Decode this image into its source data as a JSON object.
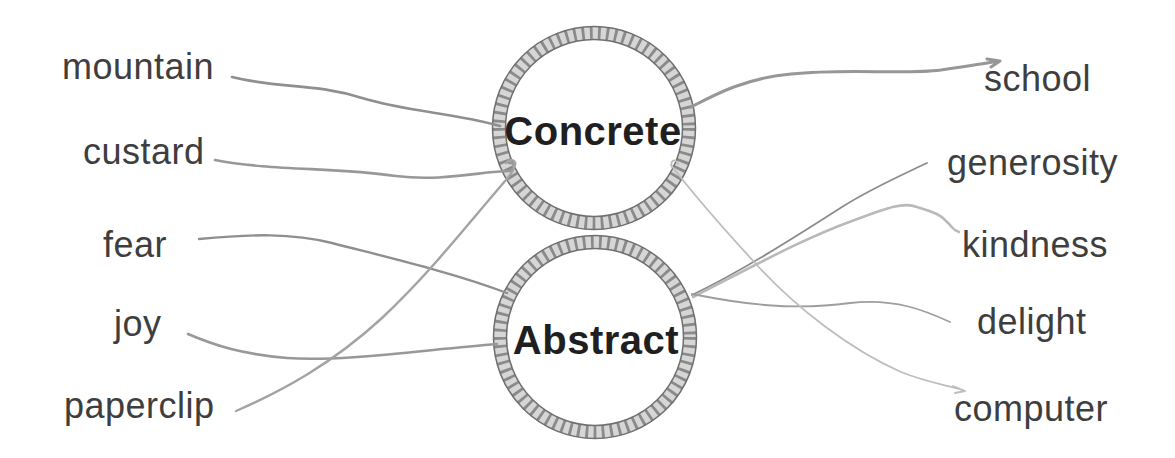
{
  "worksheet": {
    "type": "word-sorting-matching-exercise",
    "background": "#ffffff"
  },
  "categories": [
    {
      "id": "concrete",
      "label": "Concrete"
    },
    {
      "id": "abstract",
      "label": "Abstract"
    }
  ],
  "left_words": [
    {
      "label": "mountain",
      "connected_to": "Concrete"
    },
    {
      "label": "custard",
      "connected_to": "Concrete"
    },
    {
      "label": "fear",
      "connected_to": "Abstract"
    },
    {
      "label": "joy",
      "connected_to": "Abstract"
    },
    {
      "label": "paperclip",
      "connected_to": "Concrete"
    }
  ],
  "right_words": [
    {
      "label": "school",
      "connected_to": "Concrete"
    },
    {
      "label": "generosity",
      "connected_to": "Abstract"
    },
    {
      "label": "kindness",
      "connected_to": "Abstract"
    },
    {
      "label": "delight",
      "connected_to": "Abstract"
    },
    {
      "label": "computer",
      "connected_to": "Concrete"
    }
  ],
  "connections": [
    {
      "word": "mountain",
      "category": "Concrete"
    },
    {
      "word": "custard",
      "category": "Concrete"
    },
    {
      "word": "fear",
      "category": "Abstract"
    },
    {
      "word": "joy",
      "category": "Abstract"
    },
    {
      "word": "paperclip",
      "category": "Concrete"
    },
    {
      "word": "school",
      "category": "Concrete"
    },
    {
      "word": "generosity",
      "category": "Abstract"
    },
    {
      "word": "kindness",
      "category": "Abstract"
    },
    {
      "word": "delight",
      "category": "Abstract"
    },
    {
      "word": "computer",
      "category": "Concrete"
    }
  ],
  "colors": {
    "ink": "#3e3e3e",
    "category_ink": "#1f1f1f",
    "pencil_line": "#979797",
    "pencil_line_light": "#bdbdbd",
    "rope_fill": "#d6d6d6",
    "rope_outline": "#6f6f6f"
  }
}
